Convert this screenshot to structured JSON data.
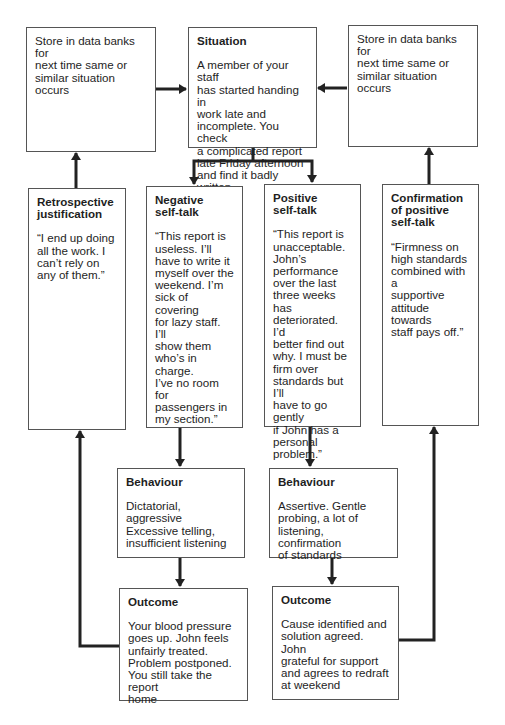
{
  "diagram": {
    "store_left": {
      "body": "Store in data banks for\nnext time same or\nsimilar situation occurs"
    },
    "situation": {
      "title": "Situation",
      "body": "A member of your staff\nhas started handing in\nwork late and\nincomplete. You check\na complicated report\nlate Friday afternoon\nand find it badly written"
    },
    "store_right": {
      "body": "Store in data banks for\nnext time same or\nsimilar situation occurs"
    },
    "retrospective": {
      "title": "Retrospective\njustification",
      "body": "“I end up doing\nall the work. I\ncan’t rely on\nany of them.”"
    },
    "negative": {
      "title": "Negative\nself-talk",
      "body": "“This report is\nuseless. I’ll\nhave to write it\nmyself over the\nweekend. I’m\nsick of covering\nfor lazy staff. I’ll\nshow them\nwho’s in charge.\nI’ve no room for\npassengers in\nmy section.”"
    },
    "positive": {
      "title": "Positive\nself-talk",
      "body": "“This report is\nunacceptable.\nJohn’s\nperformance\nover the last\nthree weeks has\ndeteriorated. I’d\nbetter find out\nwhy. I must be\nfirm over\nstandards but I’ll\nhave to go gently\nif John has a\npersonal\nproblem.”"
    },
    "confirmation": {
      "title": "Confirmation\nof positive\nself-talk",
      "body": "“Firmness on\nhigh standards\ncombined with a\nsupportive\nattitude towards\nstaff pays off.”"
    },
    "behaviour_negative": {
      "title": "Behaviour",
      "body": "Dictatorial, aggressive\nExcessive telling,\ninsufficient listening"
    },
    "behaviour_positive": {
      "title": "Behaviour",
      "body": "Assertive. Gentle\nprobing, a lot of\nlistening, confirmation\nof standards"
    },
    "outcome_negative": {
      "title": "Outcome",
      "body": "Your blood pressure\ngoes up. John feels\nunfairly treated.\nProblem postponed.\nYou still take the report\nhome"
    },
    "outcome_positive": {
      "title": "Outcome",
      "body": "Cause identified and\nsolution agreed. John\ngrateful for support\nand agrees to redraft\nat weekend"
    },
    "colors": {
      "border": "#555555",
      "arrow": "#222222",
      "text": "#1e1e1e",
      "background": "#ffffff"
    }
  }
}
